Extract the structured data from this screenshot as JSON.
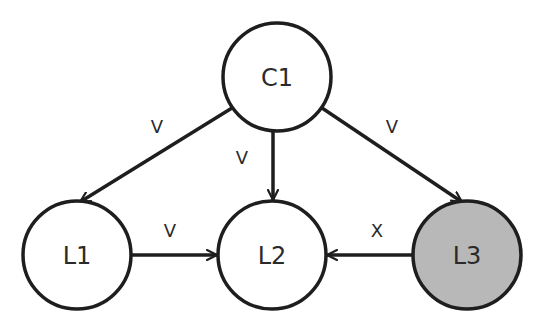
{
  "diagram": {
    "type": "directed-graph",
    "colors": {
      "stroke": "#1e1e1e",
      "node_fill": "#ffffff",
      "highlight_fill": "#b8b8b8"
    },
    "nodes": [
      {
        "id": "C1",
        "label": "C1",
        "cx": 277,
        "cy": 77,
        "r": 54,
        "fill": "#ffffff"
      },
      {
        "id": "L1",
        "label": "L1",
        "cx": 77,
        "cy": 255,
        "r": 54,
        "fill": "#ffffff"
      },
      {
        "id": "L2",
        "label": "L2",
        "cx": 272,
        "cy": 255,
        "r": 54,
        "fill": "#ffffff"
      },
      {
        "id": "L3",
        "label": "L3",
        "cx": 467,
        "cy": 255,
        "r": 54,
        "fill": "#b8b8b8"
      }
    ],
    "edges": [
      {
        "from": "C1",
        "to": "L1",
        "label": "V",
        "lx": 157,
        "ly": 133
      },
      {
        "from": "C1",
        "to": "L2",
        "label": "V",
        "lx": 242,
        "ly": 164
      },
      {
        "from": "C1",
        "to": "L3",
        "label": "V",
        "lx": 392,
        "ly": 133
      },
      {
        "from": "L1",
        "to": "L2",
        "label": "V",
        "lx": 170,
        "ly": 237
      },
      {
        "from": "L3",
        "to": "L2",
        "label": "X",
        "lx": 377,
        "ly": 237
      }
    ]
  }
}
